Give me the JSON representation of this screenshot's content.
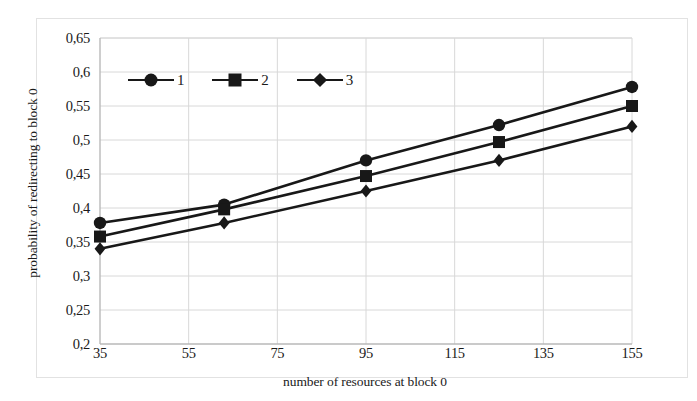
{
  "chart_data": {
    "type": "line",
    "title": "",
    "xlabel": "number of resources at block 0",
    "ylabel": "probability of redirecting to block 0",
    "xlim": [
      35,
      155
    ],
    "ylim": [
      0.2,
      0.65
    ],
    "x_ticks": [
      "35",
      "55",
      "75",
      "95",
      "115",
      "135",
      "155"
    ],
    "x_tick_values": [
      35,
      55,
      75,
      95,
      115,
      135,
      155
    ],
    "y_ticks": [
      "0,2",
      "0,25",
      "0,3",
      "0,35",
      "0,4",
      "0,45",
      "0,5",
      "0,55",
      "0,6",
      "0,65"
    ],
    "y_tick_values": [
      0.2,
      0.25,
      0.3,
      0.35,
      0.4,
      0.45,
      0.5,
      0.55,
      0.6,
      0.65
    ],
    "grid": true,
    "legend_position": "top-left-inside",
    "decimal_separator": ",",
    "x": [
      35,
      63,
      95,
      125,
      155
    ],
    "series": [
      {
        "name": "1",
        "marker": "circle",
        "color": "#181818",
        "values": [
          0.378,
          0.405,
          0.47,
          0.522,
          0.578
        ]
      },
      {
        "name": "2",
        "marker": "square",
        "color": "#181818",
        "values": [
          0.358,
          0.398,
          0.447,
          0.497,
          0.55
        ]
      },
      {
        "name": "3",
        "marker": "diamond",
        "color": "#181818",
        "values": [
          0.34,
          0.378,
          0.425,
          0.47,
          0.52
        ]
      }
    ]
  },
  "legend": {
    "items": [
      {
        "label": "1",
        "marker": "circle"
      },
      {
        "label": "2",
        "marker": "square"
      },
      {
        "label": "3",
        "marker": "diamond"
      }
    ]
  },
  "colors": {
    "ink": "#181818",
    "grid": "#d8d8d8",
    "axis": "#b9b9b9",
    "frame": "#e2e2e2",
    "background": "#ffffff"
  }
}
